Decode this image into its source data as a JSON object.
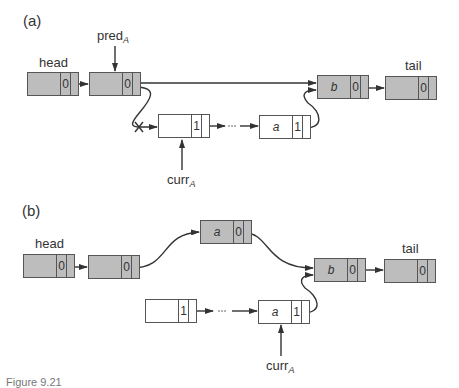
{
  "figure": {
    "caption_partial": "Figure 9.21",
    "panels": [
      {
        "label": "(a)",
        "nodes": [
          {
            "id": "a-head",
            "key": "",
            "mark": "0",
            "shaded": true,
            "label": "head"
          },
          {
            "id": "a-pred",
            "key": "",
            "mark": "0",
            "shaded": true,
            "label": ""
          },
          {
            "id": "a-curr",
            "key": "",
            "mark": "1",
            "shaded": false,
            "label": ""
          },
          {
            "id": "a-a",
            "key": "a",
            "mark": "1",
            "shaded": false,
            "label": ""
          },
          {
            "id": "a-b",
            "key": "b",
            "mark": "0",
            "shaded": true,
            "label": ""
          },
          {
            "id": "a-tail",
            "key": "",
            "mark": "0",
            "shaded": true,
            "label": "tail"
          }
        ],
        "pointers": [
          {
            "name": "pred",
            "subscript": "A",
            "target": "a-pred"
          },
          {
            "name": "curr",
            "subscript": "A",
            "target": "a-curr"
          }
        ],
        "edges": [
          {
            "from": "a-head",
            "to": "a-pred"
          },
          {
            "from": "a-pred",
            "to": "a-b",
            "style": "straight"
          },
          {
            "from": "a-pred",
            "to": "a-curr",
            "style": "curved",
            "cut": true
          },
          {
            "from": "a-curr",
            "to": "a-a",
            "ellipsis": "..."
          },
          {
            "from": "a-a",
            "to": "a-b",
            "style": "curved"
          },
          {
            "from": "a-b",
            "to": "a-tail"
          }
        ]
      },
      {
        "label": "(b)",
        "nodes": [
          {
            "id": "b-head",
            "key": "",
            "mark": "0",
            "shaded": true,
            "label": "head"
          },
          {
            "id": "b-pred",
            "key": "",
            "mark": "0",
            "shaded": true,
            "label": ""
          },
          {
            "id": "b-new",
            "key": "a",
            "mark": "0",
            "shaded": true,
            "label": ""
          },
          {
            "id": "b-m1",
            "key": "",
            "mark": "1",
            "shaded": false,
            "label": ""
          },
          {
            "id": "b-curr",
            "key": "a",
            "mark": "1",
            "shaded": false,
            "label": ""
          },
          {
            "id": "b-b",
            "key": "b",
            "mark": "0",
            "shaded": true,
            "label": ""
          },
          {
            "id": "b-tail",
            "key": "",
            "mark": "0",
            "shaded": true,
            "label": "tail"
          }
        ],
        "pointers": [
          {
            "name": "curr",
            "subscript": "A",
            "target": "b-curr"
          }
        ],
        "edges": [
          {
            "from": "b-head",
            "to": "b-pred"
          },
          {
            "from": "b-pred",
            "to": "b-new",
            "style": "curved"
          },
          {
            "from": "b-new",
            "to": "b-b",
            "style": "curved"
          },
          {
            "from": "b-m1",
            "to": "b-curr",
            "ellipsis": "..."
          },
          {
            "from": "b-curr",
            "to": "b-b",
            "style": "curved"
          },
          {
            "from": "b-b",
            "to": "b-tail"
          }
        ]
      }
    ]
  }
}
